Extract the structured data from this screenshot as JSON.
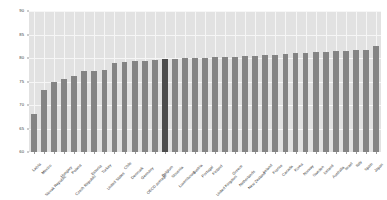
{
  "chart_data": {
    "type": "bar",
    "title": "",
    "subtitle": "",
    "xlabel": "",
    "ylabel": "",
    "ylim": [
      60,
      90
    ],
    "yticks": [
      60,
      65,
      70,
      75,
      80,
      85,
      90
    ],
    "ytick_labels": [
      "60",
      "65",
      "70",
      "75",
      "80",
      "85",
      "90"
    ],
    "grid": true,
    "legend": "none",
    "highlight_index": 13,
    "highlight_color": "#4d4d4d",
    "bar_color": "#848484",
    "plot_background": "#e2e2e2",
    "categories": [
      "Latvia",
      "Mexico",
      "Slovak Republic",
      "Hungary",
      "Poland",
      "Czech Republic",
      "Estonia",
      "Turkey",
      "United States",
      "Chile",
      "Denmark",
      "Germany",
      "OECD average",
      "Belgium",
      "Slovenia",
      "Luxembourg",
      "Austria",
      "Portugal",
      "Finland",
      "United Kingdom",
      "Greece",
      "Netherlands",
      "New Zealand",
      "Ireland",
      "France",
      "Canada",
      "Korea",
      "Norway",
      "Sweden",
      "Iceland",
      "Australia",
      "Israel",
      "Italy",
      "Spain",
      "Japan"
    ],
    "values": [
      68.0,
      73.2,
      75.0,
      75.5,
      76.1,
      77.2,
      77.3,
      77.5,
      78.9,
      79.2,
      79.3,
      79.4,
      79.6,
      79.8,
      79.8,
      79.9,
      80.0,
      80.1,
      80.2,
      80.2,
      80.3,
      80.4,
      80.5,
      80.6,
      80.7,
      80.9,
      81.0,
      81.1,
      81.2,
      81.3,
      81.4,
      81.5,
      81.6,
      81.7,
      82.5
    ]
  }
}
